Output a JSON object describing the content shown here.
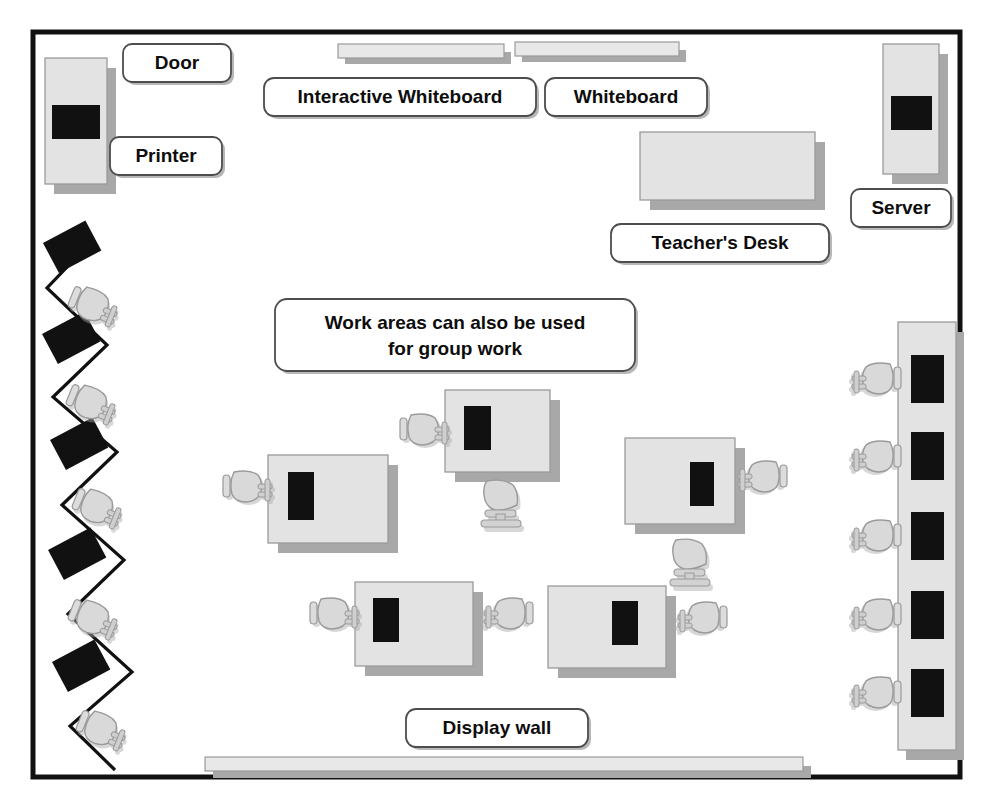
{
  "diagram": {
    "room": {
      "border_color": "#111111",
      "fill_color": "#ffffff",
      "x": 33,
      "y": 32,
      "width": 927,
      "height": 745
    },
    "palette": {
      "furniture_fill": "#e3e3e3",
      "furniture_stroke": "#8c8c8c",
      "shadow": "#a8a8a8",
      "screen_dark": "#111111",
      "chair_fill": "#d9d9d9",
      "chair_stroke": "#9a9a9a",
      "label_fill": "#ffffff",
      "label_stroke": "#4d4d4d",
      "text": "#0d0d0d"
    },
    "labels": [
      {
        "id": "door",
        "text": "Door",
        "x": 177,
        "y": 62,
        "w": 108,
        "h": 38
      },
      {
        "id": "printer",
        "text": "Printer",
        "x": 166,
        "y": 155,
        "w": 112,
        "h": 38
      },
      {
        "id": "iwb",
        "text": "Interactive Whiteboard",
        "x": 400,
        "y": 96,
        "w": 272,
        "h": 38
      },
      {
        "id": "whiteboard",
        "text": "Whiteboard",
        "x": 626,
        "y": 96,
        "w": 162,
        "h": 38
      },
      {
        "id": "server",
        "text": "Server",
        "x": 901,
        "y": 208,
        "w": 100,
        "h": 38
      },
      {
        "id": "teachers-desk",
        "text": "Teacher's Desk",
        "x": 720,
        "y": 243,
        "w": 218,
        "h": 38
      },
      {
        "id": "display-wall",
        "text": "Display wall",
        "x": 497,
        "y": 727,
        "w": 182,
        "h": 38
      }
    ],
    "callout": {
      "id": "work-areas-note",
      "line1": "Work areas can also be used",
      "line2": "for group work",
      "x": 455,
      "y": 335,
      "w": 360,
      "h": 72
    },
    "equipment": {
      "printer_unit": {
        "x": 45,
        "y": 58,
        "w": 62,
        "h": 126
      },
      "server_unit": {
        "x": 883,
        "y": 44,
        "w": 58,
        "h": 130
      },
      "teacher_desk_top": {
        "x": 640,
        "y": 132,
        "w": 175,
        "h": 68
      },
      "whiteboard_strips": [
        {
          "x": 338,
          "y": 44,
          "w": 165,
          "h": 16
        },
        {
          "x": 515,
          "y": 42,
          "w": 162,
          "h": 16
        }
      ],
      "display_wall_strip": {
        "x": 205,
        "y": 758,
        "w": 598,
        "h": 14
      }
    },
    "left_wall": {
      "description": "zigzag counter with monitors and chairs",
      "monitor_count": 5,
      "chair_count": 5,
      "monitors_y": [
        258,
        345,
        442,
        534,
        620,
        700
      ],
      "chairs_y": [
        300,
        394,
        486,
        578,
        662,
        735
      ]
    },
    "right_bench": {
      "description": "long bench along right wall",
      "x": 898,
      "y": 322,
      "w": 62,
      "h": 430,
      "monitor_count": 5,
      "chair_count": 5
    },
    "workstations": [
      {
        "id": "ws-center-left",
        "x": 268,
        "y": 455,
        "w": 120,
        "h": 88,
        "chairs": [
          "left"
        ]
      },
      {
        "id": "ws-center-top",
        "x": 445,
        "y": 390,
        "w": 105,
        "h": 82,
        "chairs": [
          "left",
          "bottom"
        ]
      },
      {
        "id": "ws-center-right",
        "x": 625,
        "y": 438,
        "w": 110,
        "h": 86,
        "chairs": [
          "right",
          "bottom"
        ]
      },
      {
        "id": "ws-bottom-left",
        "x": 355,
        "y": 582,
        "w": 118,
        "h": 84,
        "chairs": [
          "left",
          "right"
        ]
      },
      {
        "id": "ws-bottom-right",
        "x": 548,
        "y": 586,
        "w": 118,
        "h": 82,
        "chairs": [
          "right"
        ]
      }
    ],
    "counts": {
      "total_workstations": 5,
      "left_wall_stations": 5,
      "right_bench_stations": 5
    }
  }
}
